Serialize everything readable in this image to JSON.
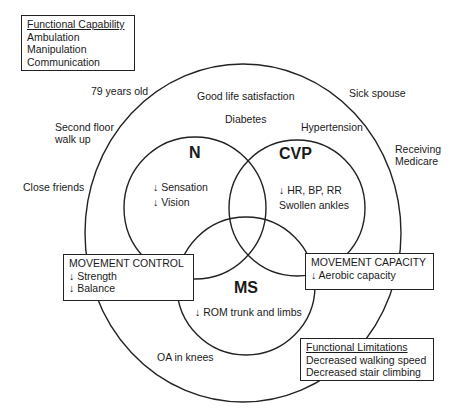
{
  "functional_capability": {
    "title": "Functional Capability",
    "items": [
      "Ambulation",
      "Manipulation",
      "Communication"
    ]
  },
  "outer_factors": {
    "age": "79 years old",
    "life_satisfaction": "Good life satisfaction",
    "sick_spouse": "Sick spouse",
    "second_floor": "Second floor\nwalk up",
    "diabetes": "Diabetes",
    "hypertension": "Hypertension",
    "receiving_medicare": "Receiving\nMedicare",
    "close_friends": "Close friends",
    "oa_knees": "OA in knees"
  },
  "circles": {
    "n": {
      "label": "N",
      "items": [
        "↓ Sensation",
        "↓ Vision"
      ]
    },
    "cvp": {
      "label": "CVP",
      "items": [
        "↓ HR, BP, RR",
        "Swollen ankles"
      ]
    },
    "ms": {
      "label": "MS",
      "items": [
        "↓ ROM trunk and limbs"
      ]
    }
  },
  "movement_control": {
    "title": "MOVEMENT CONTROL",
    "items": [
      "↓ Strength",
      "↓ Balance"
    ]
  },
  "movement_capacity": {
    "title": "MOVEMENT CAPACITY",
    "items": [
      "↓ Aerobic capacity"
    ]
  },
  "functional_limitations": {
    "title": "Functional Limitations",
    "items": [
      "Decreased walking speed",
      "Decreased stair climbing"
    ]
  }
}
